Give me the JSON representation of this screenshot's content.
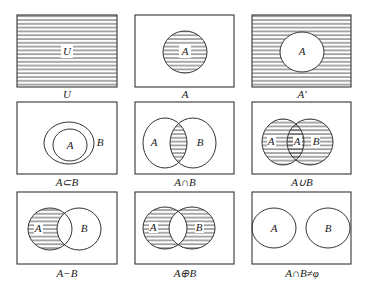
{
  "colors": {
    "stroke": "#333333",
    "hatch": "#555555",
    "background": "#ffffff"
  },
  "panels": [
    {
      "id": "universal",
      "caption": "U",
      "labels": [
        "U"
      ]
    },
    {
      "id": "set-a",
      "caption": "A",
      "labels": [
        "A"
      ]
    },
    {
      "id": "complement",
      "caption": "A′",
      "labels": [
        "A"
      ]
    },
    {
      "id": "subset",
      "caption": "A⊂B",
      "labels": [
        "A",
        "B"
      ]
    },
    {
      "id": "intersection",
      "caption": "A∩B",
      "labels": [
        "A",
        "B"
      ]
    },
    {
      "id": "union",
      "caption": "A∪B",
      "labels": [
        "A",
        "A",
        "B"
      ]
    },
    {
      "id": "difference",
      "caption": "A−B",
      "labels": [
        "A",
        "B"
      ]
    },
    {
      "id": "symmetric-difference",
      "caption": "A⊕B",
      "labels": [
        "A",
        "B"
      ]
    },
    {
      "id": "disjoint",
      "caption": "A∩B≠φ",
      "labels": [
        "A",
        "B"
      ]
    }
  ]
}
